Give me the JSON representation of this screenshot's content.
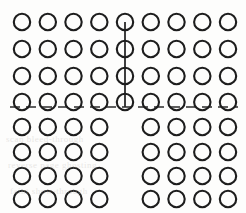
{
  "figure": {
    "width": 246,
    "height": 213,
    "background_color": "#fdfdfc",
    "stroke_color": "#1d1d1d",
    "divider_color": "#2b2b2b"
  },
  "grid": {
    "columns": 9,
    "rows": 8,
    "column_x": [
      22,
      47.8,
      73.5,
      99.3,
      125,
      150.8,
      176.5,
      202.3,
      228
    ],
    "row_y": [
      22,
      49,
      76,
      102,
      127,
      152,
      176,
      199
    ],
    "circle_radius": 8.2,
    "upper_rows": [
      0,
      1,
      2,
      3
    ],
    "lower_rows": [
      4,
      5,
      6,
      7
    ],
    "upper_row_columns": [
      0,
      1,
      2,
      3,
      4,
      5,
      6,
      7,
      8
    ],
    "lower_row_columns": [
      0,
      1,
      2,
      3,
      5,
      6,
      7,
      8
    ],
    "missing_column_lower": 4
  },
  "connector": {
    "column_index": 4,
    "x": 125,
    "y_start": 22,
    "y_end": 107,
    "description": "vertical line through column 5 of upper block terminating at dashed divider"
  },
  "divider": {
    "y": 107,
    "x_start": 10,
    "x_end": 238,
    "dash_length": 10,
    "gap_length": 6,
    "style": "dashed"
  },
  "background_artifacts": [
    {
      "text": "scan bleed-through",
      "x": 6,
      "y": 140
    },
    {
      "text": "reverse page ghosting",
      "x": 8,
      "y": 166
    },
    {
      "text": "faint show-through",
      "x": 10,
      "y": 190
    }
  ],
  "chart_data": {
    "type": "scatter",
    "xlabel": "",
    "ylabel": "",
    "columns": 9,
    "rows": 8,
    "upper_block_nodes_per_row": 9,
    "lower_block_nodes_per_row": 8,
    "total_nodes": 68,
    "series": [
      {
        "name": "upper-block-row-1",
        "values": [
          1,
          1,
          1,
          1,
          1,
          1,
          1,
          1,
          1
        ]
      },
      {
        "name": "upper-block-row-2",
        "values": [
          1,
          1,
          1,
          1,
          1,
          1,
          1,
          1,
          1
        ]
      },
      {
        "name": "upper-block-row-3",
        "values": [
          1,
          1,
          1,
          1,
          1,
          1,
          1,
          1,
          1
        ]
      },
      {
        "name": "upper-block-row-4",
        "values": [
          1,
          1,
          1,
          1,
          1,
          1,
          1,
          1,
          1
        ]
      },
      {
        "name": "lower-block-row-5",
        "values": [
          1,
          1,
          1,
          1,
          0,
          1,
          1,
          1,
          1
        ]
      },
      {
        "name": "lower-block-row-6",
        "values": [
          1,
          1,
          1,
          1,
          0,
          1,
          1,
          1,
          1
        ]
      },
      {
        "name": "lower-block-row-7",
        "values": [
          1,
          1,
          1,
          1,
          0,
          1,
          1,
          1,
          1
        ]
      },
      {
        "name": "lower-block-row-8",
        "values": [
          1,
          1,
          1,
          1,
          0,
          1,
          1,
          1,
          1
        ]
      }
    ],
    "annotations": [
      "dashed horizontal divider between row 4 and row 5",
      "vertical connector along column 5 spanning rows 1-4"
    ],
    "grid": false,
    "legend": "none"
  }
}
